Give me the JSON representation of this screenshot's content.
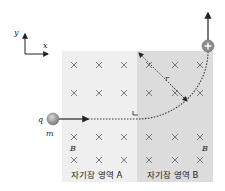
{
  "axes": {
    "x_label": "x",
    "y_label": "y"
  },
  "charge": {
    "q_label": "q",
    "m_label": "m",
    "sign": "+"
  },
  "regions": [
    {
      "label": "자기장 영역 A",
      "field_label": "B",
      "fill": "#efefef"
    },
    {
      "label": "자기장 영역 B",
      "field_label": "B",
      "fill": "#dcdcdc"
    }
  ],
  "radius_label": "r",
  "colors": {
    "particle": "#8a8a8a",
    "path": "#333333",
    "cross": "#6b6b6b"
  }
}
